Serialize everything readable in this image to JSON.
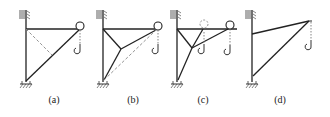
{
  "figure": {
    "panels": [
      {
        "id": "a",
        "label": "(a)",
        "label_x": 54
      },
      {
        "id": "b",
        "label": "(b)",
        "label_x": 133
      },
      {
        "id": "c",
        "label": "(c)",
        "label_x": 203
      },
      {
        "id": "d",
        "label": "(d)",
        "label_x": 280
      }
    ],
    "colors": {
      "stroke": "#222222",
      "dashed": "#777777"
    }
  }
}
